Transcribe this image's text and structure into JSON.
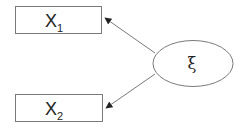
{
  "diagram": {
    "type": "measurement-model",
    "nodes": [
      {
        "id": "x1",
        "shape": "rectangle",
        "label": "X",
        "subscript": "1"
      },
      {
        "id": "x2",
        "shape": "rectangle",
        "label": "X",
        "subscript": "2"
      },
      {
        "id": "xi",
        "shape": "ellipse",
        "label": "ξ"
      }
    ],
    "edges": [
      {
        "from": "xi",
        "to": "x1",
        "directed": true
      },
      {
        "from": "xi",
        "to": "x2",
        "directed": true
      }
    ],
    "colors": {
      "stroke": "#7a7a7a",
      "text": "#222222",
      "background": "#ffffff"
    }
  }
}
